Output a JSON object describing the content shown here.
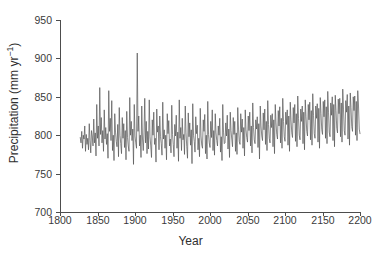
{
  "chart_data": {
    "type": "line",
    "title": "",
    "xlabel": "Year",
    "ylabel": "Precipitation (mm yr−1)",
    "ylabel_text": "Precipitation (mm yr",
    "ylabel_exponent": "−1",
    "ylabel_suffix": ")",
    "xlim": [
      1800,
      2200
    ],
    "ylim": [
      700,
      950
    ],
    "xticks": [
      1800,
      1850,
      1900,
      1950,
      2000,
      2050,
      2100,
      2150,
      2200
    ],
    "yticks": [
      700,
      750,
      800,
      850,
      900,
      950
    ],
    "xtick_labels": [
      "1800",
      "1850",
      "1900",
      "1950",
      "2000",
      "2050",
      "2100",
      "2150",
      "2200"
    ],
    "ytick_labels": [
      "700",
      "750",
      "800",
      "850",
      "900",
      "950"
    ],
    "grid": false,
    "legend": false,
    "line_color": "#555555",
    "line_width": 0.7,
    "background": "#ffffff",
    "series": [
      {
        "name": "Annual precipitation",
        "x_start": 1827,
        "x_end": 2200,
        "values": [
          797,
          790,
          805,
          783,
          800,
          795,
          812,
          779,
          801,
          788,
          796,
          781,
          815,
          793,
          777,
          806,
          799,
          786,
          821,
          790,
          803,
          773,
          840,
          796,
          812,
          786,
          862,
          801,
          823,
          790,
          806,
          779,
          833,
          795,
          810,
          788,
          802,
          770,
          858,
          805,
          822,
          793,
          845,
          780,
          800,
          767,
          828,
          804,
          792,
          785,
          814,
          772,
          836,
          800,
          789,
          776,
          823,
          796,
          815,
          784,
          806,
          768,
          831,
          797,
          786,
          779,
          849,
          800,
          818,
          793,
          808,
          762,
          840,
          799,
          790,
          783,
          907,
          805,
          825,
          786,
          800,
          771,
          838,
          795,
          780,
          803,
          848,
          790,
          818,
          776,
          805,
          782,
          846,
          798,
          786,
          771,
          820,
          800,
          830,
          788,
          796,
          765,
          834,
          804,
          812,
          781,
          825,
          798,
          789,
          774,
          843,
          795,
          807,
          783,
          800,
          768,
          828,
          802,
          819,
          786,
          795,
          777,
          839,
          801,
          788,
          772,
          814,
          799,
          826,
          783,
          804,
          766,
          846,
          796,
          810,
          780,
          822,
          794,
          801,
          775,
          838,
          803,
          785,
          770,
          829,
          798,
          816,
          787,
          807,
          763,
          841,
          800,
          792,
          778,
          824,
          802,
          813,
          781,
          796,
          772,
          835,
          799,
          787,
          783,
          820,
          805,
          827,
          776,
          800,
          769,
          844,
          801,
          790,
          784,
          818,
          797,
          833,
          780,
          806,
          774,
          828,
          803,
          793,
          786,
          812,
          800,
          822,
          778,
          798,
          767,
          840,
          804,
          789,
          790,
          816,
          799,
          826,
          782,
          808,
          771,
          830,
          806,
          795,
          785,
          823,
          801,
          818,
          779,
          803,
          775,
          836,
          808,
          792,
          788,
          828,
          804,
          821,
          783,
          810,
          773,
          833,
          807,
          797,
          791,
          825,
          806,
          830,
          786,
          812,
          777,
          842,
          810,
          794,
          789,
          820,
          808,
          824,
          784,
          815,
          769,
          838,
          812,
          799,
          793,
          829,
          807,
          834,
          788,
          818,
          780,
          845,
          814,
          796,
          790,
          826,
          810,
          828,
          785,
          820,
          776,
          840,
          816,
          801,
          795,
          832,
          812,
          837,
          790,
          822,
          783,
          848,
          818,
          798,
          792,
          830,
          814,
          833,
          787,
          825,
          779,
          843,
          820,
          803,
          797,
          836,
          816,
          840,
          792,
          828,
          785,
          851,
          822,
          800,
          794,
          834,
          818,
          838,
          789,
          830,
          781,
          846,
          824,
          805,
          799,
          840,
          820,
          843,
          794,
          832,
          787,
          854,
          826,
          802,
          796,
          838,
          822,
          841,
          791,
          835,
          783,
          849,
          828,
          807,
          801,
          844,
          824,
          846,
          796,
          837,
          789,
          857,
          830,
          804,
          798,
          842,
          826,
          850,
          793,
          840,
          785,
          852,
          832,
          809,
          803,
          847,
          828,
          848,
          798,
          842,
          791,
          860,
          834,
          806,
          800,
          845,
          830,
          853,
          795,
          838,
          787,
          855,
          836,
          811,
          805,
          850,
          832,
          851,
          800,
          844,
          793,
          858,
          838,
          808,
          802
        ]
      }
    ]
  }
}
